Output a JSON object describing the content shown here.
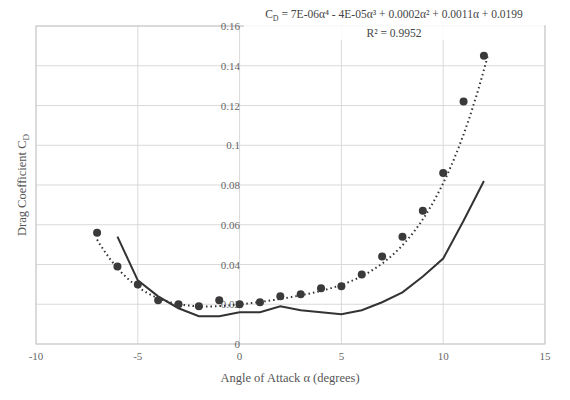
{
  "chart_data": {
    "type": "scatter",
    "title": "",
    "xlabel": "Angle of Attack α (degrees)",
    "ylabel": "Drag Coefficient C_D",
    "xlim": [
      -10,
      15
    ],
    "ylim": [
      0,
      0.16
    ],
    "x_ticks": [
      "-10",
      "-5",
      "0",
      "5",
      "10",
      "15"
    ],
    "y_ticks": [
      "0",
      "0.02",
      "0.04",
      "0.06",
      "0.08",
      "0.1",
      "0.12",
      "0.14",
      "0.16"
    ],
    "grid": true,
    "legend": "none",
    "series": [
      {
        "name": "Experimental C_D",
        "style": "markers",
        "color": "#3a3a3a",
        "x": [
          -7,
          -6,
          -5,
          -4,
          -3,
          -2,
          -1,
          0,
          1,
          2,
          3,
          4,
          5,
          6,
          7,
          8,
          9,
          10,
          11,
          12
        ],
        "y": [
          0.056,
          0.039,
          0.03,
          0.022,
          0.02,
          0.019,
          0.022,
          0.02,
          0.021,
          0.024,
          0.025,
          0.028,
          0.029,
          0.035,
          0.044,
          0.054,
          0.067,
          0.086,
          0.122,
          0.145
        ]
      },
      {
        "name": "Reference C_D",
        "style": "solid-line",
        "color": "#3a3a3a",
        "x": [
          -6,
          -5,
          -4,
          -3,
          -2,
          -1,
          0,
          1,
          2,
          3,
          4,
          5,
          6,
          7,
          8,
          9,
          10,
          11,
          12
        ],
        "y": [
          0.054,
          0.032,
          0.024,
          0.018,
          0.014,
          0.014,
          0.016,
          0.016,
          0.019,
          0.017,
          0.016,
          0.015,
          0.017,
          0.021,
          0.026,
          0.034,
          0.043,
          0.062,
          0.082
        ]
      },
      {
        "name": "Poly. (Experimental C_D)",
        "style": "dotted-trendline",
        "color": "#3a3a3a",
        "coefficients": [
          7e-06,
          -4e-05,
          0.0002,
          0.0011,
          0.0199
        ],
        "x_range": [
          -7,
          12.2
        ]
      }
    ],
    "annotations": [
      {
        "text": "C_D = 7E-06α⁴ - 4E-05α³ + 0.0002α² + 0.0011α + 0.0199"
      },
      {
        "text": "R² = 0.9952"
      }
    ]
  },
  "labels": {
    "xlabel": "Angle of Attack α (degrees)",
    "ylabel_main": "Drag Coefficient C",
    "ylabel_sub": "D",
    "eq_prefix": "C",
    "eq_sub": "D",
    "eq_body": " = 7E-06α⁴ - 4E-05α³ + 0.0002α² + 0.0011α + 0.0199",
    "r2": "R² = 0.9952"
  }
}
